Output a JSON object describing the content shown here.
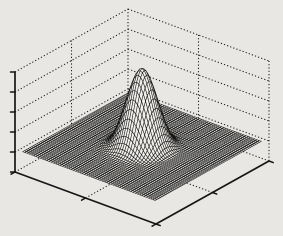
{
  "figure": {
    "background_color": "#e8e7e4",
    "title": ""
  },
  "chart_data": {
    "type": "surface",
    "render_style": "hidden-line wireframe mesh (MATLAB-style mesh plot, monochrome)",
    "title": "",
    "xlabel": "",
    "ylabel": "",
    "zlabel": "",
    "x_range": [
      -3,
      3
    ],
    "y_range": [
      -3,
      3
    ],
    "grid_cells": 60,
    "data_inset_fraction": 0.03,
    "surface_formula": "z(x,y) = A*exp(-(x^2+y^2)/(2*sigma^2)) - d*exp(-((r-r0)^2)/(2*w^2))",
    "sigma": 0.55,
    "peak_amplitude_px": 78,
    "baseline_offset_px": 20,
    "dip_ring": {
      "depth_px": 3,
      "radius": 1.15,
      "width": 0.25
    },
    "axes": {
      "z_ticks": 6,
      "x_ticks": 3,
      "y_ticks": 3,
      "tick_labels_visible": false,
      "grid_style": "dotted",
      "box": true,
      "z_tick_spacing_px": 20,
      "tick_length_px": 4.5
    },
    "projection": {
      "left_corner": [
        15,
        172
      ],
      "front_corner": [
        156,
        224
      ],
      "right_corner": [
        269,
        161
      ],
      "box_height_px": 100
    },
    "colors": {
      "axis_line": "#161616",
      "dotted_line": "#1c1c1c",
      "mesh_line": "rgba(10,10,10,0.88)",
      "mesh_face": "#efeeea",
      "background": "#e8e7e4"
    }
  }
}
